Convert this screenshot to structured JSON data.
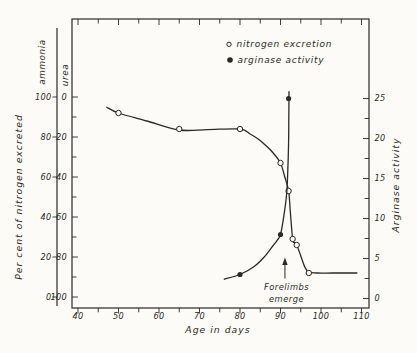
{
  "figure": {
    "bg": "#fcfbf8",
    "ink": "#2b2a25"
  },
  "chart_data": {
    "type": "line",
    "title": "",
    "x_axis": {
      "label": "Age in days",
      "min": 40,
      "max": 110,
      "major_ticks": [
        40,
        50,
        60,
        70,
        80,
        90,
        100,
        110
      ],
      "minor_step": 5
    },
    "y_left": {
      "label": "Per cent of nitrogen excreted",
      "range": [
        0,
        100
      ],
      "scales": [
        {
          "name": "ammonia",
          "ticks": [
            100,
            80,
            60,
            40,
            20,
            0
          ]
        },
        {
          "name": "urea",
          "ticks": [
            0,
            20,
            40,
            60,
            80,
            100
          ]
        }
      ]
    },
    "y_right": {
      "label": "Arginase activity",
      "range": [
        0,
        26
      ],
      "ticks": [
        25,
        20,
        15,
        10,
        5,
        0
      ],
      "minor_step": 2.5
    },
    "series": [
      {
        "name": "nitrogen excretion",
        "axis": "left",
        "marker": "open",
        "points": [
          [
            50,
            92
          ],
          [
            65,
            84
          ],
          [
            80,
            84
          ],
          [
            90,
            67
          ],
          [
            92,
            53
          ],
          [
            93,
            29
          ],
          [
            94,
            26
          ],
          [
            97,
            12
          ]
        ],
        "trace": [
          [
            47,
            95
          ],
          [
            50,
            92
          ],
          [
            57,
            88
          ],
          [
            65,
            83.5
          ],
          [
            72,
            83.7
          ],
          [
            80,
            84
          ],
          [
            82.5,
            81.5
          ],
          [
            84.5,
            79
          ],
          [
            86.5,
            75.5
          ],
          [
            88.2,
            72
          ],
          [
            90,
            67
          ],
          [
            91,
            60.5
          ],
          [
            92,
            53
          ],
          [
            92.4,
            43.5
          ],
          [
            93,
            29
          ],
          [
            93.4,
            27.3
          ],
          [
            94,
            26
          ],
          [
            95,
            20.5
          ],
          [
            96,
            15
          ],
          [
            97,
            12.4
          ],
          [
            99,
            12
          ],
          [
            103,
            12
          ],
          [
            109,
            12
          ]
        ]
      },
      {
        "name": "arginase activity",
        "axis": "right",
        "marker": "filled",
        "points": [
          [
            80,
            3
          ],
          [
            90,
            8
          ],
          [
            92,
            25
          ]
        ],
        "trace": [
          [
            76,
            2.4
          ],
          [
            80,
            3
          ],
          [
            83.5,
            4
          ],
          [
            86,
            5.2
          ],
          [
            88,
            6.5
          ],
          [
            89.2,
            7.3
          ],
          [
            90,
            8
          ],
          [
            90.8,
            10.2
          ],
          [
            91.5,
            13
          ],
          [
            91.8,
            16
          ],
          [
            92,
            19.5
          ],
          [
            92.05,
            22.5
          ],
          [
            92.1,
            25.9
          ]
        ]
      }
    ],
    "legend": [
      {
        "marker": "open",
        "label": "nitrogen excretion"
      },
      {
        "marker": "filled",
        "label": "arginase activity"
      }
    ],
    "annotation": {
      "line1": "Forelimbs",
      "line2": "emerge",
      "x_age": 91.1
    }
  }
}
